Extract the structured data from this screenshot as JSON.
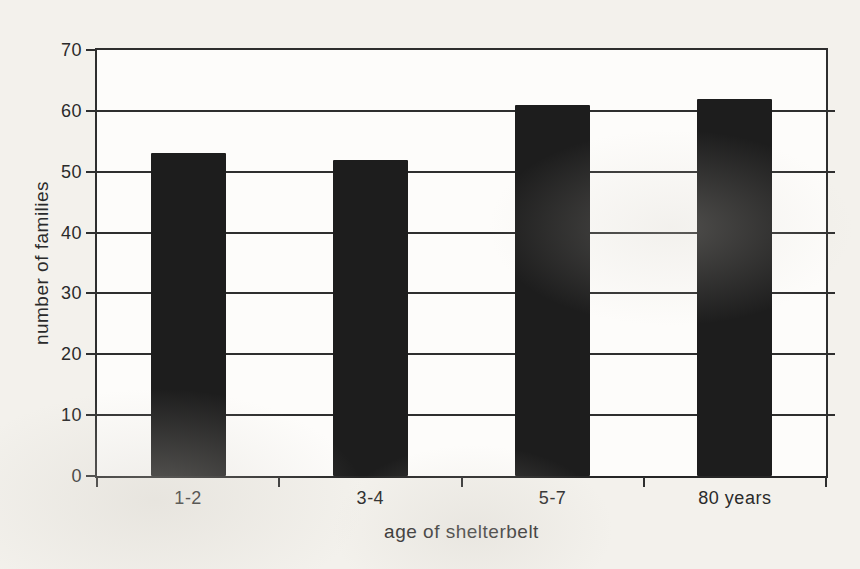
{
  "chart_data": {
    "type": "bar",
    "title": "",
    "categories": [
      "1-2",
      "3-4",
      "5-7",
      "80 years"
    ],
    "values": [
      53,
      52,
      61,
      62
    ],
    "xlabel": "age of shelterbelt",
    "ylabel": "number of families",
    "ylim": [
      0,
      70
    ],
    "yticks": [
      0,
      10,
      20,
      30,
      40,
      50,
      60,
      70
    ],
    "grid": "horizontal",
    "legend": "none",
    "bar_color": "#1d1d1d",
    "line_color": "#2e2e2e",
    "text_color": "#2a2a2a",
    "page_background": "#f3f1ec",
    "plot_background": "#fdfcfa"
  }
}
